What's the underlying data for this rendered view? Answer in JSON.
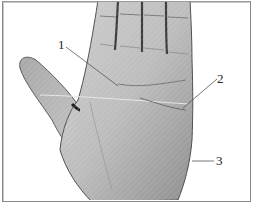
{
  "figure": {
    "labels": [
      {
        "id": "1",
        "text": "1",
        "x": 58,
        "y": 38
      },
      {
        "id": "2",
        "text": "2",
        "x": 217,
        "y": 72
      },
      {
        "id": "3",
        "text": "3",
        "x": 216,
        "y": 154
      }
    ]
  },
  "colors": {
    "border": "#8a8a8a",
    "skin_light": "#d6d6d6",
    "skin_mid": "#b4b4b4",
    "skin_dark": "#6a6a6a",
    "leader_line": "#555555",
    "background": "#ffffff"
  }
}
